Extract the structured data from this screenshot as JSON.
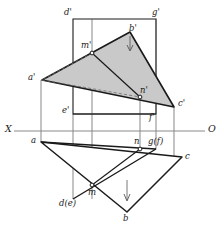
{
  "figure": {
    "width": 220,
    "height": 234,
    "background": "#ffffff"
  },
  "colors": {
    "line": "#1a1a1a",
    "thin_line": "#4a4a4a",
    "axis": "#8a8a8a",
    "fill_triangle": "#c9c9c9",
    "fill_white": "#ffffff",
    "text": "#1a1a1a"
  },
  "axis": {
    "y": 131,
    "x_start": 14,
    "x_end": 205,
    "left_label": "X",
    "right_label": "O"
  },
  "labels": [
    {
      "id": "d-prime",
      "text": "d'",
      "x": 64,
      "y": 8,
      "name": "label-d-prime"
    },
    {
      "id": "g-prime",
      "text": "g'",
      "x": 152,
      "y": 8,
      "name": "label-g-prime"
    },
    {
      "id": "b-prime",
      "text": "b'",
      "x": 129,
      "y": 24,
      "name": "label-b-prime"
    },
    {
      "id": "m-prime",
      "text": "m'",
      "x": 83,
      "y": 41,
      "name": "label-m-prime"
    },
    {
      "id": "a-prime",
      "text": "a'",
      "x": 28,
      "y": 74,
      "name": "label-a-prime"
    },
    {
      "id": "n-prime",
      "text": "n'",
      "x": 140,
      "y": 87,
      "name": "label-n-prime"
    },
    {
      "id": "c-prime",
      "text": "c'",
      "x": 178,
      "y": 99,
      "name": "label-c-prime"
    },
    {
      "id": "e-prime",
      "text": "e'",
      "x": 62,
      "y": 107,
      "name": "label-e-prime"
    },
    {
      "id": "f-prime",
      "text": "f'",
      "x": 150,
      "y": 113,
      "name": "label-f-prime"
    },
    {
      "id": "a",
      "text": "a",
      "x": 30,
      "y": 137,
      "name": "label-a"
    },
    {
      "id": "n",
      "text": "n",
      "x": 134,
      "y": 138,
      "name": "label-n"
    },
    {
      "id": "gf",
      "text": "g(f)",
      "x": 148,
      "y": 138,
      "name": "label-g-f"
    },
    {
      "id": "c",
      "text": "c",
      "x": 185,
      "y": 153,
      "name": "label-c"
    },
    {
      "id": "m",
      "text": "m",
      "x": 88,
      "y": 190,
      "name": "label-m"
    },
    {
      "id": "de",
      "text": "d(e)",
      "x": 59,
      "y": 200,
      "name": "label-d-e"
    },
    {
      "id": "b",
      "text": "b",
      "x": 123,
      "y": 215,
      "name": "label-b"
    }
  ],
  "points": {
    "d_prime": {
      "x": 73,
      "y": 19
    },
    "g_prime": {
      "x": 156,
      "y": 19
    },
    "e_prime": {
      "x": 73,
      "y": 114
    },
    "f_prime": {
      "x": 156,
      "y": 114
    },
    "a_prime": {
      "x": 42,
      "y": 80
    },
    "b_prime": {
      "x": 130,
      "y": 32
    },
    "c_prime": {
      "x": 174,
      "y": 107
    },
    "m_prime": {
      "x": 92,
      "y": 53
    },
    "n_prime": {
      "x": 140,
      "y": 97
    },
    "a": {
      "x": 41,
      "y": 142
    },
    "b": {
      "x": 127,
      "y": 212
    },
    "c": {
      "x": 182,
      "y": 157
    },
    "m": {
      "x": 92,
      "y": 185
    },
    "n": {
      "x": 140,
      "y": 149
    },
    "d_e": {
      "x": 73,
      "y": 199
    },
    "g_f": {
      "x": 156,
      "y": 149
    }
  },
  "shapes": {
    "frontal_plane_rect": "73,19 156,19 156,114 73,114",
    "triangle_front": "42,80 130,32 174,107",
    "triangle_horizontal": "41,142 127,212 182,157",
    "segment_mn_front": "92,53 140,97",
    "segment_mn_horizontal": "92,185 140,149",
    "dashed_a_to_n": "42,80 140,97",
    "dashed_m_to_a": "92,53 42,80"
  },
  "verticals": [
    {
      "name": "vertical-a",
      "x": 41,
      "y1": 80,
      "y2": 142
    },
    {
      "name": "vertical-m",
      "x": 92,
      "y1": 19,
      "y2": 199
    },
    {
      "name": "vertical-n",
      "x": 140,
      "y1": 97,
      "y2": 149
    },
    {
      "name": "vertical-fg",
      "x": 156,
      "y1": 19,
      "y2": 149
    },
    {
      "name": "vertical-c",
      "x": 174,
      "y1": 107,
      "y2": 157
    },
    {
      "name": "vertical-d",
      "x": 73,
      "y1": 114,
      "y2": 199
    }
  ],
  "arrows": [
    {
      "name": "arrow-b-prime",
      "x": 130,
      "y1": 36,
      "y2": 50,
      "dir": "down"
    },
    {
      "name": "arrow-b",
      "x": 127,
      "y1": 180,
      "y2": 200,
      "dir": "down"
    }
  ]
}
